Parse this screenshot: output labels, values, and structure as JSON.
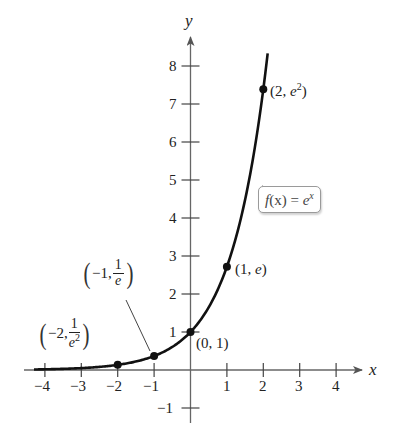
{
  "chart_data": {
    "type": "line",
    "title": "",
    "function_label": "f(x) = e^x",
    "xlabel": "x",
    "ylabel": "y",
    "xlim": [
      -4.3,
      4.6
    ],
    "ylim": [
      -1.3,
      8.7
    ],
    "x_ticks": [
      -4,
      -3,
      -2,
      -1,
      1,
      2,
      3,
      4
    ],
    "y_ticks": [
      -1,
      1,
      2,
      3,
      4,
      5,
      6,
      7,
      8
    ],
    "grid": false,
    "legend": null,
    "series": [
      {
        "name": "f(x) = e^x",
        "function": "exp",
        "x_range": [
          -4.3,
          2.1
        ],
        "color": "#111111"
      }
    ],
    "points": [
      {
        "x": -2,
        "y": 0.1353,
        "label": "(-2, 1/e^2)"
      },
      {
        "x": -1,
        "y": 0.3679,
        "label": "(-1, 1/e)"
      },
      {
        "x": 0,
        "y": 1,
        "label": "(0, 1)"
      },
      {
        "x": 1,
        "y": 2.7183,
        "label": "(1, e)"
      },
      {
        "x": 2,
        "y": 7.3891,
        "label": "(2, e^2)"
      }
    ],
    "annotations": [
      "f(x) = e^x callout pointing at curve",
      "leader line from (-1, 1/e) label to point"
    ]
  },
  "labels": {
    "x_axis": "x",
    "y_axis": "y",
    "x_ticks": [
      "−4",
      "−3",
      "−2",
      "−1",
      "1",
      "2",
      "3",
      "4"
    ],
    "y_ticks": [
      "8",
      "7",
      "6",
      "5",
      "4",
      "3",
      "2",
      "1",
      "−1"
    ],
    "pt_0_1": "(0, 1)",
    "pt_1_e_open": "(1, ",
    "pt_1_e_e": "e",
    "pt_1_e_close": ")",
    "pt_2_open": "(2, ",
    "pt_2_e": "e",
    "pt_2_exp": "2",
    "pt_2_close": ")",
    "pt_m1_prefix": "−1,",
    "pt_m1_num": "1",
    "pt_m1_den": "e",
    "pt_m2_prefix": "−2,",
    "pt_m2_num": "1",
    "pt_m2_den": "e",
    "pt_m2_exp": "2",
    "paren_open": "(",
    "paren_close": ")",
    "callout_f": "f",
    "callout_x": "(x)",
    "callout_eq": " = ",
    "callout_e": "e",
    "callout_exp": "x"
  }
}
